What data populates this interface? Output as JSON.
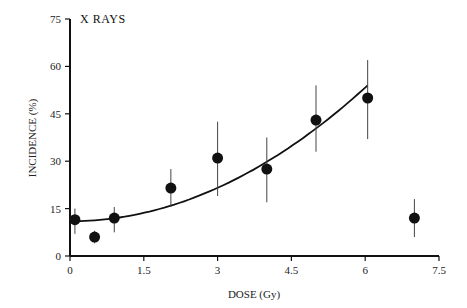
{
  "chart_data": {
    "type": "scatter",
    "title": "X RAYS",
    "xlabel": "DOSE (Gy)",
    "ylabel": "INCIDENCE (%)",
    "xlim": [
      0,
      7.5
    ],
    "ylim": [
      0,
      75
    ],
    "xticks": [
      "0",
      "1.5",
      "3",
      "4.5",
      "6",
      "7.5"
    ],
    "yticks": [
      "0",
      "15",
      "30",
      "45",
      "60",
      "75"
    ],
    "grid": false,
    "series": [
      {
        "name": "X rays",
        "points": [
          {
            "x": 0.1,
            "y": 11.5,
            "low": 7,
            "high": 15
          },
          {
            "x": 0.5,
            "y": 6,
            "low": 4,
            "high": 8
          },
          {
            "x": 0.9,
            "y": 12,
            "low": 7.5,
            "high": 15.5
          },
          {
            "x": 2.05,
            "y": 21.5,
            "low": 15.5,
            "high": 27.5
          },
          {
            "x": 3.0,
            "y": 31,
            "low": 19,
            "high": 42.5
          },
          {
            "x": 4.0,
            "y": 27.5,
            "low": 17,
            "high": 37.5
          },
          {
            "x": 5.0,
            "y": 43,
            "low": 33,
            "high": 54
          },
          {
            "x": 6.05,
            "y": 50,
            "low": 37,
            "high": 62
          },
          {
            "x": 7.0,
            "y": 12,
            "low": 6,
            "high": 18
          }
        ]
      }
    ],
    "fit_curve": {
      "type": "quadratic",
      "x_range": [
        0,
        6.05
      ],
      "y_start": 11,
      "y_end": 54
    }
  }
}
